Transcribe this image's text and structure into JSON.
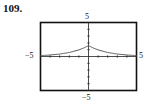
{
  "problem_number": "109.",
  "chart_data": {
    "type": "line",
    "title": "",
    "xlabel": "",
    "ylabel": "",
    "xlim": [
      -5,
      5
    ],
    "ylim": [
      -5,
      5
    ],
    "grid": false,
    "tick_spacing": 1,
    "tick_labels": {
      "x_min": "−5",
      "x_max": "5",
      "y_min": "−5",
      "y_max": "5"
    },
    "series": [
      {
        "name": "f(x)",
        "x": [
          -5,
          -4,
          -3,
          -2,
          -1,
          -0.5,
          0,
          0.5,
          1,
          2,
          3,
          4,
          5
        ],
        "values": [
          0.13,
          0.22,
          0.36,
          0.59,
          0.97,
          1.25,
          1.6,
          1.25,
          0.97,
          0.59,
          0.36,
          0.22,
          0.13
        ]
      }
    ]
  },
  "colors": {
    "curve": "#555555",
    "axes": "#222222",
    "frame": "#111111"
  }
}
